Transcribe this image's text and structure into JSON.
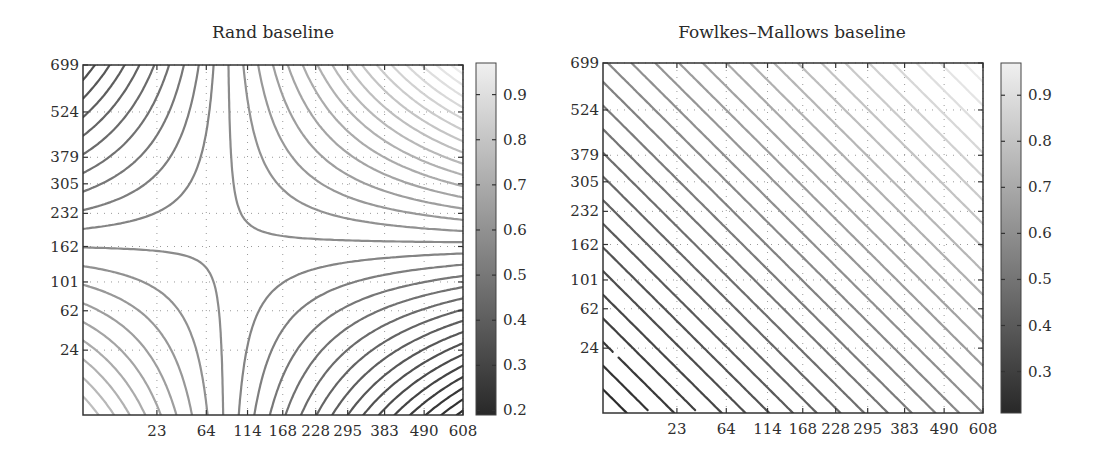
{
  "chart_data": [
    {
      "type": "contour",
      "title": "Rand baseline",
      "xlabel": "",
      "ylabel": "",
      "x_ticks": [
        23,
        64,
        114,
        168,
        228,
        295,
        383,
        490,
        608
      ],
      "y_ticks": [
        24,
        62,
        101,
        162,
        232,
        305,
        379,
        524,
        699
      ],
      "x_tick_labels": [
        "23",
        "64",
        "114",
        "168",
        "228",
        "295",
        "383",
        "490",
        "608"
      ],
      "y_tick_labels": [
        "24",
        "62",
        "101",
        "162",
        "232",
        "305",
        "379",
        "524",
        "699"
      ],
      "xlim": [
        0,
        608
      ],
      "ylim": [
        0,
        699
      ],
      "scale": "sqrt",
      "grid": "dotted",
      "colorbar": {
        "ticks": [
          0.2,
          0.3,
          0.4,
          0.5,
          0.6,
          0.7,
          0.8,
          0.9
        ],
        "tick_labels": [
          "0.2",
          "0.3",
          "0.4",
          "0.5",
          "0.6",
          "0.7",
          "0.8",
          "0.9"
        ],
        "range": [
          0.19,
          0.97
        ],
        "colormap": "gray"
      },
      "surface_model": {
        "form": "bilinear in normalized sqrt coordinates (u,v)",
        "corner_values": {
          "u0_v0": 0.8,
          "u1_v0": 0.19,
          "u0_v1": 0.33,
          "u1_v1": 0.97
        },
        "saddle": {
          "x": 300,
          "y": 355
        },
        "contour_step": 0.025
      }
    },
    {
      "type": "contour",
      "title": "Fowlkes–Mallows baseline",
      "xlabel": "",
      "ylabel": "",
      "x_ticks": [
        23,
        64,
        114,
        168,
        228,
        295,
        383,
        490,
        608
      ],
      "y_ticks": [
        24,
        62,
        101,
        162,
        232,
        305,
        379,
        524,
        699
      ],
      "x_tick_labels": [
        "23",
        "64",
        "114",
        "168",
        "228",
        "295",
        "383",
        "490",
        "608"
      ],
      "y_tick_labels": [
        "24",
        "62",
        "101",
        "162",
        "232",
        "305",
        "379",
        "524",
        "699"
      ],
      "xlim": [
        0,
        608
      ],
      "ylim": [
        0,
        699
      ],
      "scale": "sqrt",
      "grid": "dotted",
      "colorbar": {
        "ticks": [
          0.3,
          0.4,
          0.5,
          0.6,
          0.7,
          0.8,
          0.9
        ],
        "tick_labels": [
          "0.3",
          "0.4",
          "0.5",
          "0.6",
          "0.7",
          "0.8",
          "0.9"
        ],
        "range": [
          0.21,
          0.97
        ],
        "colormap": "gray"
      },
      "surface_model": {
        "form": "increasing diagonally toward upper-right",
        "corner_values": {
          "u0_v0": 0.2,
          "u1_v0": 0.6,
          "u0_v1": 0.57,
          "u1_v1": 0.97
        },
        "contour_step": 0.025
      }
    }
  ]
}
